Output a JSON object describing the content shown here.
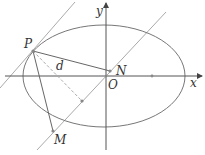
{
  "labels": {
    "P": "P",
    "d": "d",
    "N": "N",
    "O": "O",
    "x": "x",
    "y": "y",
    "M": "M"
  },
  "colors": {
    "curve": "#777777",
    "axis": "#555555",
    "line_light": "#aaaaaa",
    "dashed": "#aaaaaa",
    "point": "#888888"
  }
}
